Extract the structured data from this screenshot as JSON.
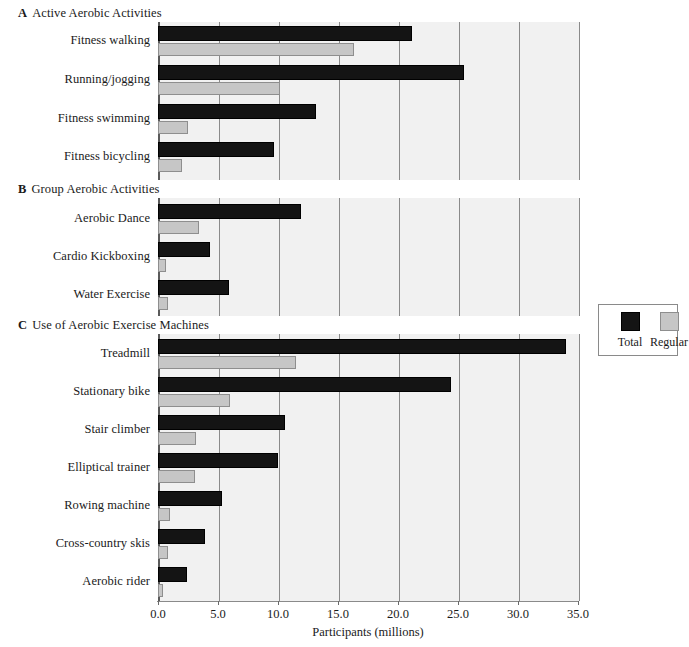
{
  "figure": {
    "background_color": "#ffffff",
    "plot_background_color": "#f1f1f1",
    "gridline_color": "#8a8a8a"
  },
  "axis": {
    "title": "Participants (millions)",
    "tick_labels": [
      "0.0",
      "5.0",
      "10.0",
      "15.0",
      "20.0",
      "25.0",
      "30.0",
      "35.0"
    ],
    "tick_values": [
      0,
      5,
      10,
      15,
      20,
      25,
      30,
      35
    ]
  },
  "legend": {
    "entries": [
      {
        "label": "Total",
        "color": "#141414"
      },
      {
        "label": "Regular",
        "color": "#c6c6c6"
      }
    ]
  },
  "sections": [
    {
      "letter": "A",
      "title": "Active Aerobic Activities"
    },
    {
      "letter": "B",
      "title": "Group Aerobic Activities"
    },
    {
      "letter": "C",
      "title": "Use of Aerobic Exercise Machines"
    }
  ],
  "chart_data": {
    "type": "bar",
    "orientation": "horizontal",
    "title": "",
    "xlabel": "Participants (millions)",
    "ylabel": "",
    "xlim": [
      0,
      35
    ],
    "xticks": [
      0,
      5,
      10,
      15,
      20,
      25,
      30,
      35
    ],
    "grid": "vertical",
    "legend_position": "right-outside",
    "series": [
      {
        "name": "Total",
        "color": "#141414"
      },
      {
        "name": "Regular",
        "color": "#c6c6c6"
      }
    ],
    "panels": [
      {
        "letter": "A",
        "title": "Active Aerobic Activities",
        "categories": [
          "Fitness walking",
          "Running/jogging",
          "Fitness swimming",
          "Fitness bicycling"
        ],
        "values": {
          "Total": [
            21.2,
            25.5,
            13.2,
            9.7
          ],
          "Regular": [
            16.3,
            10.2,
            2.5,
            2.0
          ]
        }
      },
      {
        "letter": "B",
        "title": "Group Aerobic Activities",
        "categories": [
          "Aerobic Dance",
          "Cardio Kickboxing",
          "Water Exercise"
        ],
        "values": {
          "Total": [
            11.9,
            4.3,
            5.9
          ],
          "Regular": [
            3.4,
            0.7,
            0.8
          ]
        }
      },
      {
        "letter": "C",
        "title": "Use of Aerobic Exercise Machines",
        "categories": [
          "Treadmill",
          "Stationary bike",
          "Stair climber",
          "Elliptical trainer",
          "Rowing machine",
          "Cross-country skis",
          "Aerobic rider"
        ],
        "values": {
          "Total": [
            34.0,
            24.4,
            10.6,
            10.0,
            5.3,
            3.9,
            2.4
          ],
          "Regular": [
            11.5,
            6.0,
            3.2,
            3.1,
            1.0,
            0.8,
            0.4
          ]
        }
      }
    ]
  },
  "layout": {
    "plot_left": 158,
    "plot_right": 578,
    "unit_px": 12.0,
    "panels": [
      {
        "header_y": 14,
        "plot_top": 22,
        "plot_height": 158,
        "rows": [
          {
            "label": "Fitness walking",
            "label_y": 41,
            "total_y": 26,
            "regular_y": 43
          },
          {
            "label": "Running/jogging",
            "label_y": 80,
            "total_y": 65,
            "regular_y": 82
          },
          {
            "label": "Fitness swimming",
            "label_y": 119,
            "total_y": 104,
            "regular_y": 121
          },
          {
            "label": "Fitness bicycling",
            "label_y": 157,
            "total_y": 142,
            "regular_y": 159
          }
        ]
      },
      {
        "header_y": 190,
        "plot_top": 198,
        "plot_height": 118,
        "rows": [
          {
            "label": "Aerobic Dance",
            "label_y": 219,
            "total_y": 204,
            "regular_y": 221
          },
          {
            "label": "Cardio Kickboxing",
            "label_y": 257,
            "total_y": 242,
            "regular_y": 259
          },
          {
            "label": "Water Exercise",
            "label_y": 295,
            "total_y": 280,
            "regular_y": 297
          }
        ]
      },
      {
        "header_y": 326,
        "plot_top": 334,
        "plot_height": 267,
        "rows": [
          {
            "label": "Treadmill",
            "label_y": 354,
            "total_y": 339,
            "regular_y": 356
          },
          {
            "label": "Stationary bike",
            "label_y": 392,
            "total_y": 377,
            "regular_y": 394
          },
          {
            "label": "Stair climber",
            "label_y": 430,
            "total_y": 415,
            "regular_y": 432
          },
          {
            "label": "Elliptical trainer",
            "label_y": 468,
            "total_y": 453,
            "regular_y": 470
          },
          {
            "label": "Rowing machine",
            "label_y": 506,
            "total_y": 491,
            "regular_y": 508
          },
          {
            "label": "Cross-country skis",
            "label_y": 544,
            "total_y": 529,
            "regular_y": 546
          },
          {
            "label": "Aerobic rider",
            "label_y": 582,
            "total_y": 567,
            "regular_y": 584
          }
        ]
      }
    ],
    "bar_height_total": 15,
    "bar_height_regular": 13,
    "tick_label_y": 607,
    "axis_title_y": 625,
    "legend": {
      "x": 598,
      "y": 304,
      "w": 80,
      "h": 52
    }
  }
}
